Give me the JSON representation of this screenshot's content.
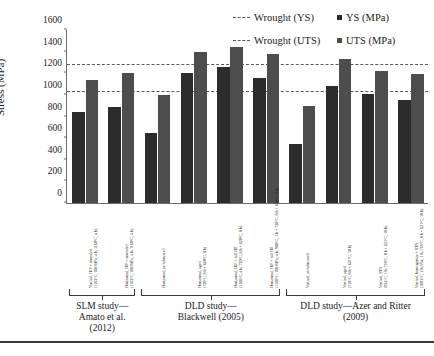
{
  "chart": {
    "type": "bar",
    "ylabel": "Stress (MPa)"
  },
  "legend": {
    "wrought_ys": "Wrought (YS)",
    "wrought_uts": "Wrought (UTS)",
    "ys": "YS (MPa)",
    "uts": "UTS (MPa)"
  },
  "groups": [
    {
      "label": "SLM study—\nAmato et al.\n(2012)",
      "start": 0,
      "count": 2
    },
    {
      "label": "DLD study—\nBlackwell (2005)",
      "start": 2,
      "count": 4
    },
    {
      "label": "DLD study—Azer and Ritter\n(2009)",
      "start": 6,
      "count": 4
    }
  ],
  "chart_data": {
    "type": "bar",
    "title": "",
    "xlabel": "",
    "ylabel": "Stress (MPa)",
    "ylim": [
      0,
      1600
    ],
    "ytick_step": 200,
    "yticks": [
      0,
      200,
      400,
      600,
      800,
      1000,
      1200,
      1400,
      1600
    ],
    "grid": false,
    "legend_position": "top-right",
    "categories": [
      "Vertical, HIP + annealed (1163°C, 100 MPa, 4 h; 1160°C, 4 h)",
      "Horizontal, HIP + annealed (1163°C, 100 MPa, 4 h; 1160°C, 4 h)",
      "Horizontal, as-fabricated",
      "Horizontal, aged (720°C, 8 h + 620°C, 8 h)",
      "Horizontal, HIP + full HT (1160°C, 4 h; 720°C, 8 h + 620°C, 8 h)",
      "Horizontal, HIP + full HT (1160°C, 100 MPa, 4 h; 980°C, 1 h + 720°C, 8 h + 620°C, 8 h)",
      "Vertical, as-fabricated",
      "Vertical, aged (718°C, 8 h + 621°C, 10 h)",
      "Vertical, STA (954°C, 1 h; 718°C, 8 h + 621°C, 10 h)",
      "Vertical, homogenize + STA (1093°C, 2 h; 954, 1 h; 718°C, 8 h + 621°C, 10 h)"
    ],
    "series": [
      {
        "name": "YS (MPa)",
        "color": "#2c2c2c",
        "values": [
          845,
          890,
          645,
          1205,
          1255,
          1155,
          550,
          1085,
          1010,
          950
        ]
      },
      {
        "name": "UTS (MPa)",
        "color": "#4d4d4d",
        "values": [
          1135,
          1200,
          1000,
          1395,
          1440,
          1380,
          900,
          1335,
          1225,
          1195
        ]
      }
    ],
    "reference_lines": [
      {
        "name": "Wrought (YS)",
        "value": 1030,
        "style": "dashed",
        "color": "#5a5a5a"
      },
      {
        "name": "Wrought (UTS)",
        "value": 1280,
        "style": "dashed",
        "color": "#5a5a5a"
      }
    ]
  }
}
